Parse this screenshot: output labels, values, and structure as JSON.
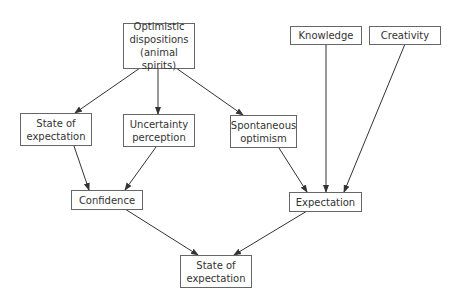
{
  "diagram": {
    "nodes": [
      {
        "id": "optimistic",
        "label": "Optimistic\ndispositions\n(animal spirits)"
      },
      {
        "id": "state_left",
        "label": "State of\nexpectation"
      },
      {
        "id": "uncertainty",
        "label": "Uncertainty\nperception"
      },
      {
        "id": "spontaneous",
        "label": "Spontaneous\noptimism"
      },
      {
        "id": "knowledge",
        "label": "Knowledge"
      },
      {
        "id": "creativity",
        "label": "Creativity"
      },
      {
        "id": "confidence",
        "label": "Confidence"
      },
      {
        "id": "expectation",
        "label": "Expectation"
      },
      {
        "id": "state_bottom",
        "label": "State of\nexpectation"
      }
    ],
    "edges": [
      {
        "from": "optimistic",
        "to": "state_left"
      },
      {
        "from": "optimistic",
        "to": "uncertainty"
      },
      {
        "from": "optimistic",
        "to": "spontaneous"
      },
      {
        "from": "state_left",
        "to": "confidence"
      },
      {
        "from": "uncertainty",
        "to": "confidence"
      },
      {
        "from": "spontaneous",
        "to": "expectation"
      },
      {
        "from": "knowledge",
        "to": "expectation"
      },
      {
        "from": "creativity",
        "to": "expectation"
      },
      {
        "from": "confidence",
        "to": "state_bottom"
      },
      {
        "from": "expectation",
        "to": "state_bottom"
      }
    ]
  }
}
